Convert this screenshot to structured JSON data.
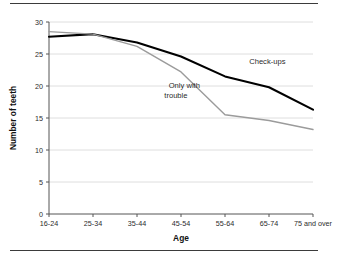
{
  "figure": {
    "top_rule": "horizontal-rule",
    "bottom_rule": "horizontal-rule"
  },
  "chart_data": {
    "type": "line",
    "title": "",
    "xlabel": "Age",
    "ylabel": "Number of teeth",
    "categories": [
      "16-24",
      "25-34",
      "35-44",
      "45-54",
      "55-64",
      "65-74",
      "75 and over"
    ],
    "series": [
      {
        "name": "Check-ups",
        "color": "#000000",
        "values": [
          27.7,
          28.1,
          26.8,
          24.6,
          21.5,
          19.8,
          16.3
        ]
      },
      {
        "name": "Only with trouble",
        "color": "#9b9b9b",
        "values": [
          28.5,
          28.1,
          26.2,
          22.2,
          15.5,
          14.6,
          13.2
        ]
      }
    ],
    "ylim": [
      0,
      30
    ],
    "yticks": [
      0,
      5,
      10,
      15,
      20,
      25,
      30
    ],
    "ytick_labels": [
      "0",
      "5",
      "10",
      "15",
      "20",
      "25",
      "30"
    ],
    "grid": "horizontal",
    "grid_color": "#d6d6d6",
    "legend": "inline-annotations",
    "annotations": [
      {
        "text": "Check-ups",
        "x_index": 4.55,
        "value": 23.4
      },
      {
        "text": "Only with",
        "x_index": 2.72,
        "value": 19.7
      },
      {
        "text": "trouble",
        "x_index": 2.62,
        "value": 18.2
      }
    ]
  }
}
